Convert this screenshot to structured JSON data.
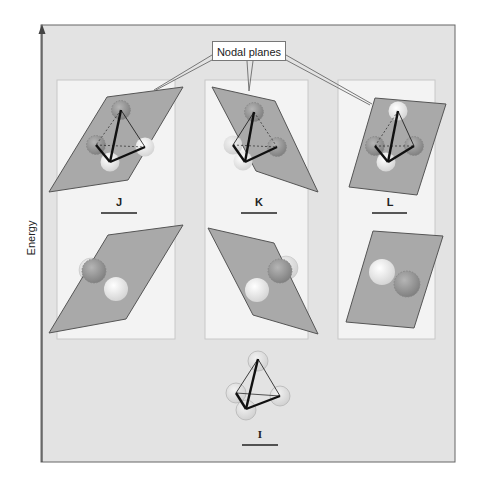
{
  "figure": {
    "y_axis_label": "Energy",
    "callout_label": "Nodal planes",
    "colors": {
      "outer_background": "#e3e3e3",
      "panel_background": "#f3f3f3",
      "plane_fill": "#a9a9a9",
      "frame_border": "#666666"
    },
    "panels": [
      {
        "id": "J",
        "label": "J",
        "description": "Tetrahedron with nodal plane (upper level)"
      },
      {
        "id": "K",
        "label": "K",
        "description": "Tetrahedron with nodal plane (upper level)"
      },
      {
        "id": "L",
        "label": "L",
        "description": "Tetrahedron with nodal plane (upper level)"
      }
    ],
    "ground_state": {
      "id": "I",
      "label": "I",
      "description": "Tetrahedron with four spheres, no nodal plane"
    }
  }
}
